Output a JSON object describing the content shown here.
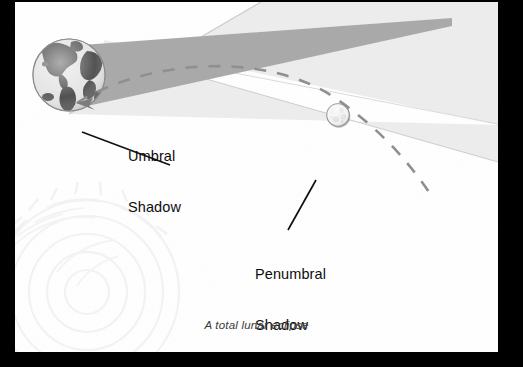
{
  "figure": {
    "caption": "A total lunar eclipse",
    "alt_title": "A total lunar eclipse",
    "labels": {
      "umbral_line1": "Umbral",
      "umbral_line2": "Shadow",
      "penumbral_line1": "Penumbral",
      "penumbral_line2": "Shadow"
    },
    "objects": {
      "earth": "earth-globe",
      "moon": "moon-disc",
      "umbra": "umbral-shadow-cone",
      "penumbra": "penumbral-shadow-cone",
      "orbit": "moon-orbit-dashed-path",
      "orbit_arrow": "orbit-direction-arrow",
      "watermark": "decorative-watermark"
    },
    "colors": {
      "page_border": "#000000",
      "paper": "#ffffff",
      "umbra_fill": "#a9a9a9",
      "penumbra_fill": "#ededed",
      "penumbra_edge": "#c9c9c9",
      "leader_line": "#121212",
      "orbit_dash": "#8f8f8f",
      "earth_land": "#4a4a4a",
      "earth_ocean": "#d8d8d8",
      "moon_fill": "#f0f0f0",
      "moon_edge": "#9a9a9a",
      "text": "#0d0d0d",
      "caption_text": "#3b3b3b",
      "watermark": "#f4f4f4"
    }
  }
}
